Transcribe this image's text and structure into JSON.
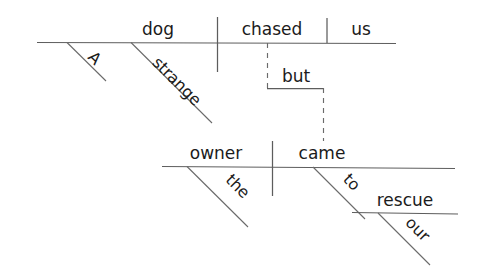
{
  "diagram": {
    "type": "reed-kellogg-sentence-diagram",
    "sentence": "A strange dog chased us but the owner came to our rescue",
    "background_color": "#ffffff",
    "line_color": "#5d5d5d",
    "text_color": "#1b1b1b",
    "clauses": [
      {
        "id": "clause-1",
        "text": "A strange dog chased us",
        "subject": "dog",
        "verb": "chased",
        "direct_object": "us",
        "modifiers": [
          "A",
          "strange"
        ]
      },
      {
        "id": "clause-2",
        "text": "the owner came to our rescue",
        "subject": "owner",
        "verb": "came",
        "modifiers": [
          "the"
        ],
        "prepositional_phrase": {
          "preposition": "to",
          "object": "rescue",
          "object_modifier": "our"
        }
      }
    ],
    "conjunction": "but",
    "words": {
      "determiner_a": "A",
      "adjective_strange": "strange",
      "subject_dog": "dog",
      "verb_chased": "chased",
      "object_us": "us",
      "conjunction_but": "but",
      "determiner_the": "the",
      "subject_owner": "owner",
      "verb_came": "came",
      "preposition_to": "to",
      "determiner_our": "our",
      "object_rescue": "rescue"
    }
  }
}
